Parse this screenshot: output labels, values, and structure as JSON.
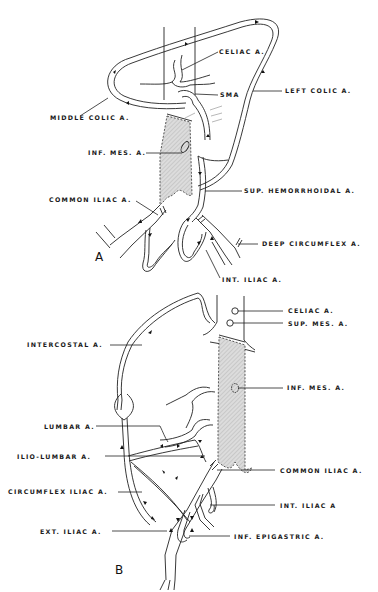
{
  "figure": {
    "panels": [
      {
        "id": "A",
        "letter": "A",
        "labels": {
          "celiac": "CELIAC A.",
          "sma": "SMA",
          "left_colic": "LEFT COLIC A.",
          "middle_colic": "MIDDLE COLIC A.",
          "inf_mes": "INF. MES. A.",
          "sup_hemorrhoidal": "SUP. HEMORRHOIDAL A.",
          "common_iliac": "COMMON ILIAC A.",
          "deep_circumflex": "DEEP CIRCUMFLEX A.",
          "int_iliac": "INT. ILIAC A."
        }
      },
      {
        "id": "B",
        "letter": "B",
        "labels": {
          "celiac": "CELIAC A.",
          "sup_mes": "SUP. MES. A.",
          "intercostal": "INTERCOSTAL A.",
          "inf_mes": "INF. MES. A.",
          "lumbar": "LUMBAR A.",
          "ilio_lumbar": "ILIO-LUMBAR A.",
          "common_iliac": "COMMON ILIAC A.",
          "circumflex_iliac": "CIRCUMFLEX ILIAC A.",
          "int_iliac": "INT. ILIAC A",
          "ext_iliac": "EXT. ILIAC A.",
          "inf_epigastric": "INF. EPIGASTRIC A."
        }
      }
    ],
    "colors": {
      "background": "#ffffff",
      "ink": "#222222",
      "occluded_aorta_fill": "#cfcfcf"
    }
  }
}
